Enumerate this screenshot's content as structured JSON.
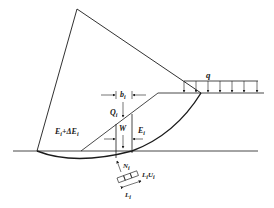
{
  "diagram": {
    "type": "slope-stability-slice-method",
    "labels": {
      "q": "q",
      "b": "b",
      "b_sub": "i",
      "Q": "Q",
      "Q_sub": "i",
      "W": "W",
      "E_right": "E",
      "E_right_sub": "i",
      "E_left": "E",
      "E_left_sub": "i",
      "E_left_plus": "+ΔE",
      "E_left_plus_sub": "i",
      "N": "N",
      "N_sub": "i",
      "LU": "L",
      "LU_sub1": "i",
      "LU_U": "U",
      "LU_sub2": "i",
      "L": "L",
      "L_sub": "i"
    },
    "colors": {
      "stroke": "#1a1a1a",
      "background": "#ffffff",
      "ground_line": "#555555"
    }
  }
}
